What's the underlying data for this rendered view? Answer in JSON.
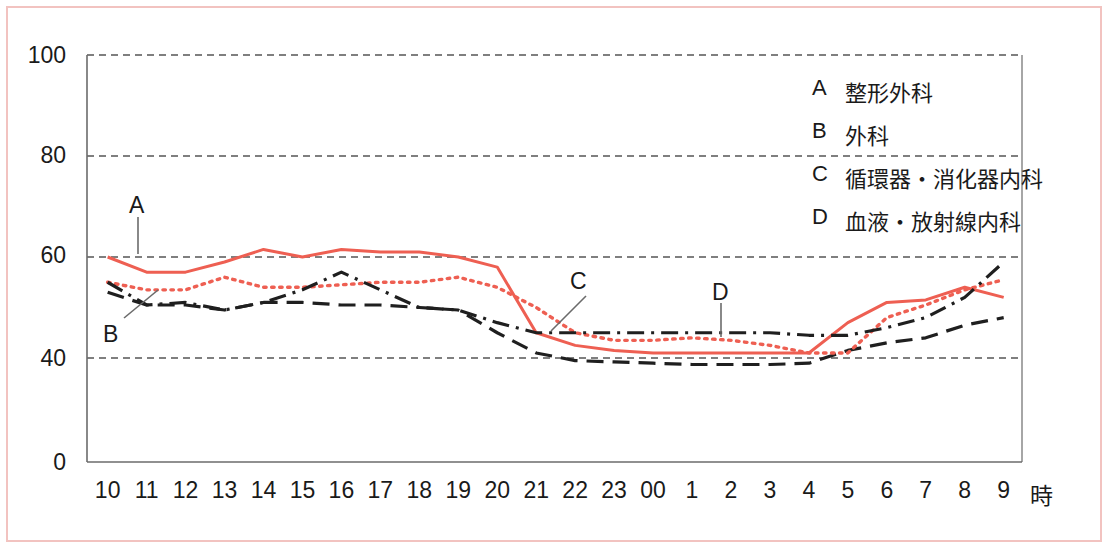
{
  "chart_data": {
    "type": "line",
    "title": "",
    "xlabel": "時",
    "ylabel": "",
    "xlim": [
      0,
      23
    ],
    "ylim": [
      0,
      100
    ],
    "yticks": [
      0,
      40,
      60,
      80,
      100
    ],
    "ytick_labels": [
      "0",
      "40",
      "60",
      "80",
      "100"
    ],
    "grid": "horizontal-dashed",
    "axis_break": "y-axis compressed between 0 and 40",
    "legend_position": "upper-right-inside",
    "categories": [
      "10",
      "11",
      "12",
      "13",
      "14",
      "15",
      "16",
      "17",
      "18",
      "19",
      "20",
      "21",
      "22",
      "23",
      "00",
      "1",
      "2",
      "3",
      "4",
      "5",
      "6",
      "7",
      "8",
      "9"
    ],
    "series": [
      {
        "name": "A",
        "label": "整形外科",
        "style": "solid",
        "color": "#ee5f52",
        "values": [
          60,
          57,
          57,
          59,
          61.5,
          60,
          61.5,
          61,
          61,
          60,
          58,
          45,
          42.5,
          41.5,
          41,
          41,
          41,
          41,
          41,
          47,
          51,
          51.5,
          54,
          52
        ]
      },
      {
        "name": "B",
        "label": "外科",
        "style": "dashed",
        "color": "#1f1f1f",
        "values": [
          53,
          50.5,
          50.5,
          49.5,
          51,
          51,
          50.5,
          50.5,
          50,
          49.5,
          45,
          41,
          39,
          38.5,
          38,
          37.5,
          37.5,
          37.5,
          38,
          41.5,
          43,
          44,
          46.5,
          48
        ]
      },
      {
        "name": "C",
        "label": "循環器・消化器内科",
        "style": "dotted",
        "color": "#ee5f52",
        "values": [
          55,
          53.5,
          53.5,
          56,
          54,
          54,
          54.5,
          55,
          55,
          56,
          54,
          50,
          45,
          43.5,
          43.5,
          44,
          43.5,
          42.5,
          41,
          41,
          48,
          50.5,
          53.5,
          55.5
        ]
      },
      {
        "name": "D",
        "label": "血液・放射線内科",
        "style": "dashdot",
        "color": "#1f1f1f",
        "values": [
          55,
          50.5,
          51,
          49.5,
          51,
          53.5,
          57,
          53.5,
          50,
          49.5,
          47,
          45,
          45,
          45,
          45,
          45,
          45,
          45,
          44.5,
          44.5,
          46,
          48,
          52,
          59
        ]
      }
    ],
    "annotations": [
      {
        "text": "A",
        "series": "A",
        "x_hour": "10",
        "leader": "vertical"
      },
      {
        "text": "B",
        "series": "B",
        "x_hour": "10",
        "leader": "diagonal"
      },
      {
        "text": "C",
        "series": "C",
        "x_hour": "21",
        "leader": "diagonal"
      },
      {
        "text": "D",
        "series": "D",
        "x_hour": "1",
        "leader": "vertical"
      }
    ]
  },
  "legend": {
    "items": [
      {
        "key": "A",
        "label": "整形外科"
      },
      {
        "key": "B",
        "label": "外科"
      },
      {
        "key": "C",
        "label": "循環器・消化器内科"
      },
      {
        "key": "D",
        "label": "血液・放射線内科"
      }
    ]
  },
  "axis": {
    "y_labels": [
      "100",
      "80",
      "60",
      "40",
      "0"
    ],
    "x_labels": [
      "10",
      "11",
      "12",
      "13",
      "14",
      "15",
      "16",
      "17",
      "18",
      "19",
      "20",
      "21",
      "22",
      "23",
      "00",
      "1",
      "2",
      "3",
      "4",
      "5",
      "6",
      "7",
      "8",
      "9"
    ],
    "x_unit": "時"
  },
  "annotation_labels": {
    "a": "A",
    "b": "B",
    "c": "C",
    "d": "D"
  },
  "colors": {
    "series_red": "#ee5f52",
    "series_black": "#1f1f1f",
    "frame": "#f2c3c0",
    "grid": "#555555",
    "axis": "#6b6b6b",
    "background": "#ffffff"
  }
}
